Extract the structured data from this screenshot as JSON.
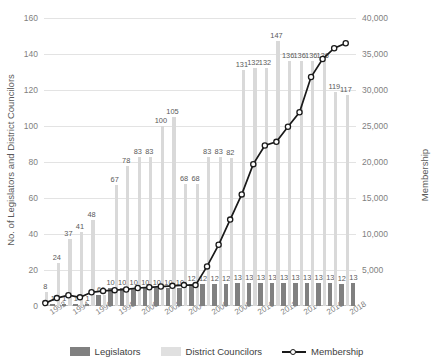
{
  "chart_data": {
    "type": "bar",
    "title": "",
    "xlabel": "",
    "ylabel": "No. of Legislators and District Councilors",
    "y2label": "Membership",
    "ylim": [
      0,
      160
    ],
    "y2lim": [
      0,
      40000
    ],
    "grid": true,
    "legend_position": "bottom",
    "yticks": [
      "0",
      "20",
      "40",
      "60",
      "80",
      "100",
      "120",
      "140",
      "160"
    ],
    "y2ticks": [
      "-",
      "5,000",
      "10,000",
      "15,000",
      "20,000",
      "25,000",
      "30,000",
      "35,000",
      "40,000"
    ],
    "categories": [
      "1992",
      "1993",
      "1994",
      "1995",
      "1996",
      "1997",
      "1998",
      "1999",
      "2000",
      "2001",
      "2002",
      "2003",
      "2004",
      "2005",
      "2006",
      "2007",
      "2008",
      "2009",
      "2010",
      "2011",
      "2012",
      "2013",
      "2014",
      "2015",
      "2016",
      "2017",
      "2018"
    ],
    "xtick_labels": [
      "1992",
      "",
      "1994",
      "",
      "1996",
      "",
      "1998",
      "",
      "2000",
      "",
      "2002",
      "",
      "2004",
      "",
      "2006",
      "",
      "2008",
      "",
      "2010",
      "",
      "2012",
      "",
      "2014",
      "",
      "2016",
      "",
      "2018"
    ],
    "series": [
      {
        "name": "Legislators",
        "type": "bar",
        "color": "#808080",
        "axis": "left",
        "values": [
          1,
          1,
          1,
          1,
          6,
          10,
          10,
          10,
          10,
          10,
          10,
          10,
          12,
          12,
          12,
          12,
          13,
          13,
          13,
          13,
          13,
          13,
          13,
          13,
          13,
          12,
          13
        ],
        "labels": [
          "1",
          "1",
          "1",
          "1",
          "6",
          "10",
          "10",
          "10",
          "10",
          "10",
          "10",
          "10",
          "12",
          "12",
          "12",
          "12",
          "13",
          "13",
          "13",
          "13",
          "13",
          "13",
          "13",
          "13",
          "13",
          "12",
          "13"
        ]
      },
      {
        "name": "District Councilors",
        "type": "bar",
        "color": "#d9d9d9",
        "axis": "left",
        "values": [
          8,
          24,
          37,
          41,
          48,
          6,
          67,
          78,
          83,
          83,
          100,
          105,
          68,
          68,
          83,
          83,
          82,
          131,
          132,
          132,
          147,
          136,
          136,
          136,
          136,
          119,
          117
        ],
        "labels": [
          "8",
          "24",
          "37",
          "41",
          "48",
          "6",
          "67",
          "78",
          "83",
          "83",
          "100",
          "105",
          "68",
          "68",
          "83",
          "83",
          "82",
          "131",
          "132",
          "132",
          "147",
          "136",
          "136",
          "136",
          "136",
          "119",
          "117"
        ]
      },
      {
        "name": "Membership",
        "type": "line",
        "color": "#1a1a1a",
        "axis": "right",
        "values": [
          400,
          1100,
          1500,
          1200,
          1900,
          2100,
          2200,
          2300,
          2500,
          2600,
          2700,
          2800,
          2900,
          2900,
          5500,
          8500,
          12000,
          15500,
          19700,
          22300,
          22800,
          24900,
          26900,
          31800,
          34300,
          35800,
          36500
        ]
      }
    ]
  },
  "legend": {
    "items": [
      {
        "label": "Legislators"
      },
      {
        "label": "District Councilors"
      },
      {
        "label": "Membership"
      }
    ]
  }
}
